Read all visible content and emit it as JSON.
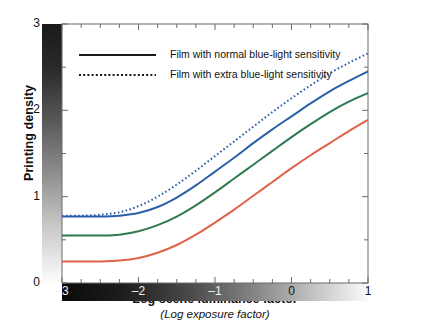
{
  "chart_data": {
    "type": "line",
    "title": "",
    "xlabel": "Log scene luminance factor",
    "xsublabel": "(Log exposure factor)",
    "ylabel": "Printing density",
    "xlim": [
      -3,
      1
    ],
    "ylim": [
      0,
      3
    ],
    "xticks": [
      -3,
      -2,
      -1,
      0,
      1
    ],
    "xtick_labels": [
      "–3",
      "–2",
      "–1",
      "0",
      "1"
    ],
    "yticks": [
      0,
      1,
      2,
      3
    ],
    "ytick_labels": [
      "0",
      "1",
      "2",
      "3"
    ],
    "x_minor_step": 0.25,
    "y_minor_step": 0.5,
    "grid": false,
    "legend_position": "top-left-inside",
    "axis_gradients": {
      "y_axis": "dark at density 3 (top) to white at density 0 (bottom)",
      "x_axis": "black at –3 (left) to white at 1 (right)"
    },
    "legend": [
      {
        "label": "Film with normal blue-light sensitivity",
        "style": "solid",
        "color": "#1a1a1a"
      },
      {
        "label": "Film with extra blue-light sensitivity",
        "style": "dotted",
        "color": "#1a1a1a"
      }
    ],
    "series": [
      {
        "name": "Extra blue-light sensitivity",
        "style": "dotted",
        "color": "#2c5fa8",
        "x": [
          -3.0,
          -2.75,
          -2.5,
          -2.25,
          -2.0,
          -1.75,
          -1.5,
          -1.25,
          -1.0,
          -0.75,
          -0.5,
          -0.25,
          0.0,
          0.25,
          0.5,
          0.75,
          1.0
        ],
        "y": [
          0.78,
          0.78,
          0.79,
          0.82,
          0.89,
          1.0,
          1.14,
          1.3,
          1.47,
          1.64,
          1.81,
          1.98,
          2.14,
          2.29,
          2.43,
          2.55,
          2.66
        ]
      },
      {
        "name": "Normal blue-light sensitivity (blue)",
        "style": "solid",
        "color": "#2c5fa8",
        "x": [
          -3.0,
          -2.75,
          -2.5,
          -2.25,
          -2.0,
          -1.75,
          -1.5,
          -1.25,
          -1.0,
          -0.75,
          -0.5,
          -0.25,
          0.0,
          0.25,
          0.5,
          0.75,
          1.0
        ],
        "y": [
          0.77,
          0.77,
          0.77,
          0.78,
          0.81,
          0.88,
          0.99,
          1.13,
          1.29,
          1.45,
          1.62,
          1.78,
          1.93,
          2.08,
          2.22,
          2.34,
          2.45
        ]
      },
      {
        "name": "Green record",
        "style": "solid",
        "color": "#2f7a4f",
        "x": [
          -3.0,
          -2.75,
          -2.5,
          -2.25,
          -2.0,
          -1.75,
          -1.5,
          -1.25,
          -1.0,
          -0.75,
          -0.5,
          -0.25,
          0.0,
          0.25,
          0.5,
          0.75,
          1.0
        ],
        "y": [
          0.55,
          0.55,
          0.55,
          0.56,
          0.6,
          0.67,
          0.77,
          0.9,
          1.05,
          1.21,
          1.37,
          1.53,
          1.69,
          1.84,
          1.98,
          2.1,
          2.2
        ]
      },
      {
        "name": "Red record",
        "style": "solid",
        "color": "#e06248",
        "x": [
          -3.0,
          -2.75,
          -2.5,
          -2.25,
          -2.0,
          -1.75,
          -1.5,
          -1.25,
          -1.0,
          -0.75,
          -0.5,
          -0.25,
          0.0,
          0.25,
          0.5,
          0.75,
          1.0
        ],
        "y": [
          0.25,
          0.25,
          0.25,
          0.26,
          0.29,
          0.35,
          0.44,
          0.56,
          0.7,
          0.85,
          1.01,
          1.17,
          1.33,
          1.48,
          1.62,
          1.76,
          1.89
        ]
      }
    ]
  }
}
